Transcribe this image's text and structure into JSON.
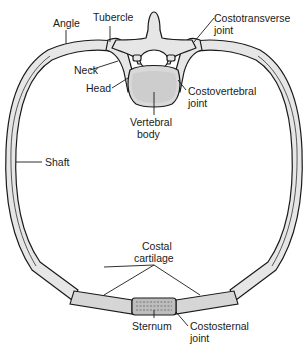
{
  "figure": {
    "type": "anatomical-diagram"
  },
  "labels": {
    "angle": "Angle",
    "tubercle": "Tubercle",
    "neck": "Neck",
    "head": "Head",
    "costotransverse_1": "Costotransverse",
    "costotransverse_2": "joint",
    "costovertebral_1": "Costovertebral",
    "costovertebral_2": "joint",
    "vertebral_1": "Vertebral",
    "vertebral_2": "body",
    "shaft": "Shaft",
    "costal_1": "Costal",
    "costal_2": "cartilage",
    "sternum": "Sternum",
    "costosternal_1": "Costosternal",
    "costosternal_2": "joint"
  },
  "colors": {
    "bone_fill": "#e6e6e6",
    "outline": "#1a1a1a",
    "background": "#ffffff"
  }
}
